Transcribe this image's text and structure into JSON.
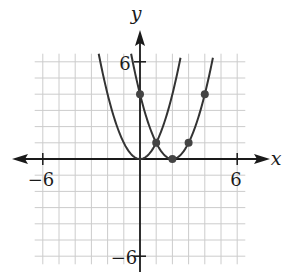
{
  "chart_data": {
    "type": "line",
    "title": "",
    "xlabel": "x",
    "ylabel": "y",
    "xlim": [
      -6.5,
      6.5
    ],
    "ylim": [
      -6.5,
      6.5
    ],
    "grid": true,
    "x_tick_labels": [
      "-6",
      "6"
    ],
    "y_tick_labels": [
      "6",
      "-6"
    ],
    "series": [
      {
        "name": "y = x^2",
        "vertex": [
          0,
          0
        ],
        "function": "x^2",
        "points": []
      },
      {
        "name": "y = (x - 2)^2",
        "vertex": [
          2,
          0
        ],
        "function": "(x-2)^2",
        "points": [
          [
            0,
            4
          ],
          [
            1,
            1
          ],
          [
            2,
            0
          ],
          [
            3,
            1
          ],
          [
            4,
            4
          ]
        ]
      }
    ]
  },
  "labels": {
    "x_axis": "x",
    "y_axis": "y",
    "x_neg": "−6",
    "x_pos": "6",
    "y_pos": "6",
    "y_neg": "−6"
  },
  "colors": {
    "grid": "#cccccc",
    "axis": "#1a1a1a",
    "curve": "#333333",
    "point": "#444444"
  }
}
